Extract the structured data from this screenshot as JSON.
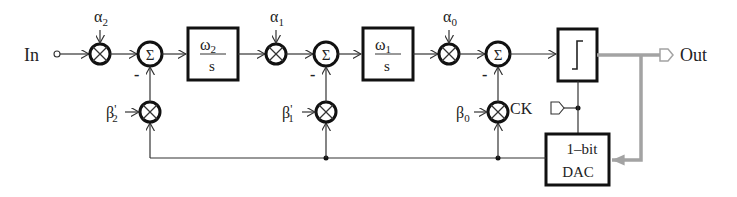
{
  "diagram": {
    "title": "",
    "type": "third-order continuous-time sigma-delta modulator block diagram",
    "input_label": "In",
    "output_label": "Out",
    "clock_label": "CK",
    "colors": {
      "line": "#333333",
      "output_path": "#a3a3a3",
      "background": "#ffffff"
    },
    "gains_forward": [
      {
        "symbol": "α",
        "sub": "2"
      },
      {
        "symbol": "α",
        "sub": "1"
      },
      {
        "symbol": "α",
        "sub": "0"
      }
    ],
    "gains_feedback": [
      {
        "symbol": "β",
        "prime": "'",
        "sub": "2"
      },
      {
        "symbol": "β",
        "prime": "'",
        "sub": "1"
      },
      {
        "symbol": "β",
        "prime": "",
        "sub": "0"
      }
    ],
    "summers": [
      {
        "symbol": "Σ",
        "minus": "-"
      },
      {
        "symbol": "Σ",
        "minus": "-"
      },
      {
        "symbol": "Σ",
        "minus": "-"
      }
    ],
    "integrators": [
      {
        "num": "ω",
        "num_sub": "2",
        "den": "s"
      },
      {
        "num": "ω",
        "num_sub": "1",
        "den": "s"
      }
    ],
    "quantizer": {
      "symbol": "comparator-step"
    },
    "dac": {
      "line1": "1–bit",
      "line2": "DAC"
    }
  }
}
